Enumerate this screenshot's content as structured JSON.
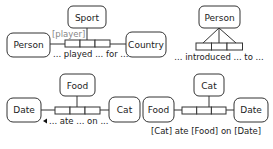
{
  "diagram1": {
    "top_entity": "Sport",
    "left_entity": "Person",
    "right_entity": "Country",
    "role_label": "[player]",
    "reading": "... played ... for ..."
  },
  "diagram2": {
    "top_entity": "Person",
    "reading": "... introduced ... to ..."
  },
  "diagram3": {
    "top_entity": "Food",
    "left_entity": "Date",
    "right_entity": "Cat",
    "reading": "... ate ... on ...",
    "arrow_glyph": "◄"
  },
  "diagram4": {
    "top_entity": "Cat",
    "left_entity": "Food",
    "right_entity": "Date",
    "reading": "[Cat] ate [Food] on [Date]"
  },
  "colors": {
    "line": "#333333",
    "role_text": "#888888",
    "text": "#222222"
  }
}
